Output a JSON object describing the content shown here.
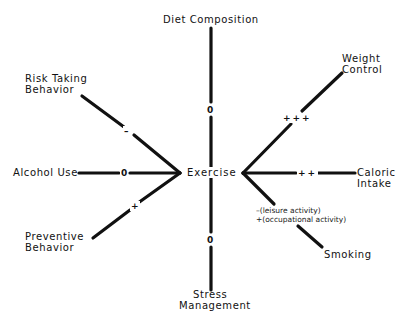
{
  "diagram": {
    "center": "Exercise",
    "nodes": {
      "top": "Diet Composition",
      "bottom_line1": "Stress",
      "bottom_line2": "Management",
      "risk_line1": "Risk Taking",
      "risk_line2": "Behavior",
      "alcohol": "Alcohol Use",
      "preventive_line1": "Preventive",
      "preventive_line2": "Behavior",
      "weight_line1": "Weight",
      "weight_line2": "Control",
      "caloric_line1": "Caloric",
      "caloric_line2": "Intake",
      "smoking": "Smoking"
    },
    "relations": {
      "diet": "0",
      "stress": "0",
      "risk": "–",
      "alcohol": "0",
      "preventive": "+",
      "weight": "+++",
      "caloric": "++",
      "smoking_note1": "–(leisure activity)",
      "smoking_note2": "+(occupational activity)"
    },
    "line_color": "#111111"
  }
}
